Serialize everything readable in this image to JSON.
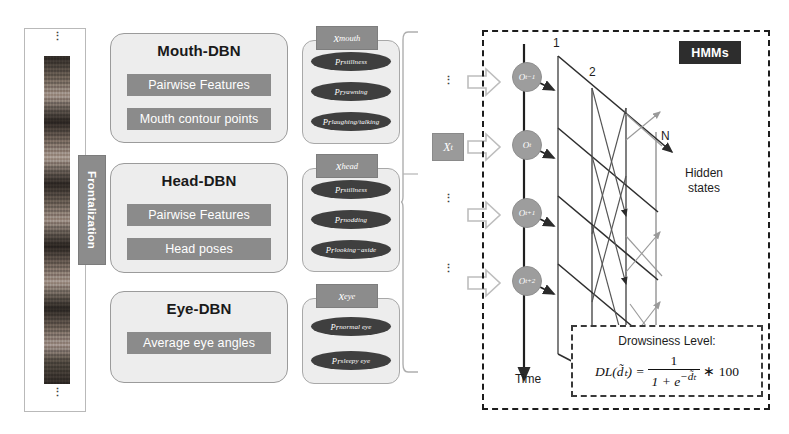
{
  "left_column": {
    "name": "face-frames-column",
    "top_dots": "⋮",
    "bottom_dots": "⋮",
    "frontalization_label": "Frontalization"
  },
  "dbn_modules": [
    {
      "id": "mouth",
      "title": "Mouth-DBN",
      "bars": [
        "Pairwise Features",
        "Mouth contour points"
      ]
    },
    {
      "id": "head",
      "title": "Head-DBN",
      "bars": [
        "Pairwise Features",
        "Head poses"
      ]
    },
    {
      "id": "eye",
      "title": "Eye-DBN",
      "bars": [
        "Average eye angles"
      ]
    }
  ],
  "probability_groups": [
    {
      "id": "mouth",
      "badge_base": "x",
      "badge_sup": "mouth",
      "ellipses": [
        {
          "base": "Pr",
          "sup": "stillness"
        },
        {
          "base": "Pr",
          "sup": "yawning"
        },
        {
          "base": "Pr",
          "sup": "laughing/talking"
        }
      ]
    },
    {
      "id": "head",
      "badge_base": "x",
      "badge_sup": "head",
      "ellipses": [
        {
          "base": "Pr",
          "sup": "stillness"
        },
        {
          "base": "Pr",
          "sup": "nodding"
        },
        {
          "base": "Pr",
          "sup": "looking−aside"
        }
      ]
    },
    {
      "id": "eye",
      "badge_base": "x",
      "badge_sup": "eye",
      "ellipses": [
        {
          "base": "Pr",
          "sup": "normal eye"
        },
        {
          "base": "Pr",
          "sup": "sleepy eye"
        }
      ]
    }
  ],
  "aggregate": {
    "xt_base": "X",
    "xt_sub": "t"
  },
  "hmm": {
    "badge": "HMMs",
    "observation_nodes": [
      {
        "base": "O",
        "sub": "t−1"
      },
      {
        "base": "O",
        "sub": "t"
      },
      {
        "base": "O",
        "sub": "t+1"
      },
      {
        "base": "O",
        "sub": "t+2"
      }
    ],
    "lattice_labels": [
      "1",
      "2",
      "N"
    ],
    "hidden_states_label": "Hidden\nstates",
    "hidden_states_line1": "Hidden",
    "hidden_states_line2": "states",
    "time_label": "Time",
    "vdots": [
      "⋮",
      "⋮",
      "⋮"
    ]
  },
  "drowsiness": {
    "title": "Drowsiness Level:",
    "formula_lhs": "DL(d̃ₜ) =",
    "formula_numerator": "1",
    "formula_denominator_prefix": "1 + e",
    "formula_denominator_exp": "−d̃ₜ",
    "formula_multiplier": "∗ 100"
  },
  "colors": {
    "box_fill": "#ededed",
    "box_border": "#9b9b9b",
    "bar_fill": "#8b8b8b",
    "ellipse_fill": "#3f3f3f",
    "badge_fill": "#8c8c8c",
    "node_fill": "#9d9d9d",
    "hmm_badge_fill": "#2d2d2d",
    "dashed_border": "#1c1c1c",
    "arrow_outline": "#b9b9b9",
    "lattice_dark": "#4a4a4a",
    "lattice_light": "#9a9a9a"
  }
}
